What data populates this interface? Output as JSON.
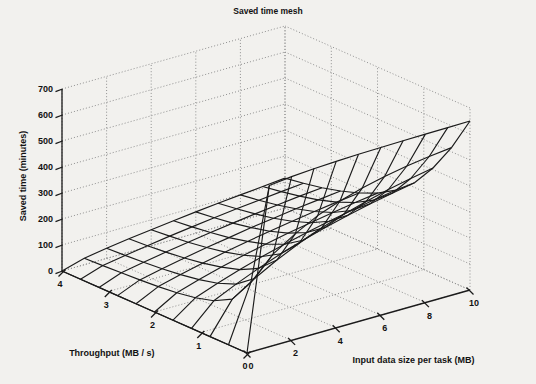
{
  "figure": {
    "title": "Saved time mesh",
    "background_color": "#f2f1ee",
    "line_color": "#1b1b1b",
    "grid_color": "#8f8f8f"
  },
  "axes": {
    "z": {
      "label": "Saved time (minutes)",
      "ticks": [
        0,
        100,
        200,
        300,
        400,
        500,
        600,
        700
      ],
      "tick_labels": [
        "0",
        "100",
        "200",
        "300",
        "400",
        "500",
        "600",
        "700"
      ],
      "range": [
        0,
        700
      ]
    },
    "x": {
      "label": "Throughput (MB / s)",
      "ticks": [
        0,
        1,
        2,
        3,
        4
      ],
      "tick_labels": [
        "0",
        "1",
        "2",
        "3",
        "4"
      ],
      "range": [
        0,
        4
      ]
    },
    "y": {
      "label": "Input data size per task (MB)",
      "ticks": [
        0,
        2,
        4,
        6,
        8,
        10
      ],
      "tick_labels": [
        "0",
        "2",
        "4",
        "6",
        "8",
        "10"
      ],
      "range": [
        0,
        10
      ]
    }
  },
  "chart_data": {
    "type": "surface",
    "title": "Saved time mesh",
    "xlabel": "Throughput (MB / s)",
    "ylabel": "Input data size per task (MB)",
    "zlabel": "Saved time (minutes)",
    "xlim": [
      0,
      4
    ],
    "ylim": [
      0,
      10
    ],
    "zlim": [
      0,
      700
    ],
    "grid": true,
    "legend": "none",
    "x": [
      0,
      0.4,
      0.8,
      1.2,
      1.6,
      2.0,
      2.4,
      2.8,
      3.2,
      3.6,
      4.0
    ],
    "y": [
      0,
      1,
      2,
      3,
      4,
      5,
      6,
      7,
      8,
      9,
      10
    ],
    "z_note": "z[yIndex][xIndex] = saved time in minutes at input size y[yIndex] and throughput x[xIndex]",
    "z": [
      [
        0,
        0,
        0,
        0,
        0,
        0,
        0,
        0,
        0,
        0,
        0
      ],
      [
        620,
        215,
        120,
        82,
        62,
        50,
        42,
        36,
        32,
        28,
        25
      ],
      [
        630,
        300,
        175,
        122,
        94,
        76,
        64,
        55,
        48,
        43,
        39
      ],
      [
        636,
        355,
        222,
        158,
        122,
        100,
        84,
        72,
        63,
        56,
        51
      ],
      [
        640,
        400,
        262,
        190,
        148,
        121,
        102,
        88,
        77,
        69,
        62
      ],
      [
        643,
        432,
        296,
        218,
        171,
        140,
        119,
        102,
        90,
        80,
        72
      ],
      [
        645,
        458,
        325,
        243,
        192,
        158,
        134,
        116,
        102,
        91,
        82
      ],
      [
        647,
        478,
        350,
        265,
        211,
        174,
        148,
        128,
        113,
        101,
        91
      ],
      [
        648,
        494,
        372,
        285,
        228,
        189,
        161,
        140,
        123,
        110,
        99
      ],
      [
        649,
        506,
        390,
        302,
        244,
        203,
        173,
        150,
        133,
        119,
        107
      ],
      [
        650,
        516,
        406,
        318,
        258,
        215,
        184,
        160,
        141,
        127,
        115
      ]
    ]
  },
  "view": {
    "azimuth_note": "standard MATLAB default 3-D view",
    "origin_corner": "front",
    "mesh_lines": "black solid",
    "wall_grid": "dotted gray"
  },
  "bleed_through": {
    "note": "faint mirrored text from the reverse side of the scanned page",
    "lines": [
      "of the reverse side of the scanned sheet shows through",
      "the paper as faint mirrored text across the figure area",
      "which does not belong to the plotted mesh itself",
      "and is only a scanning artifact of the original document"
    ]
  }
}
